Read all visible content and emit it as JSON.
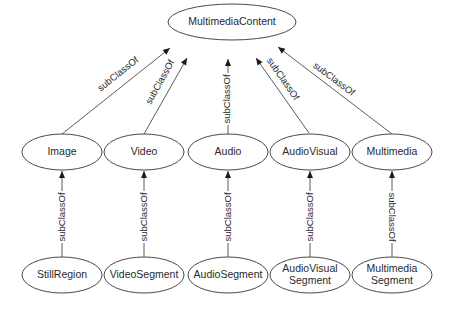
{
  "diagram": {
    "type": "class-hierarchy",
    "root": {
      "id": "multimedia-content",
      "label": "MultimediaContent",
      "cx": 232,
      "cy": 22,
      "rx": 64,
      "ry": 18
    },
    "level1": [
      {
        "id": "image",
        "label": "Image",
        "cx": 62,
        "cy": 152,
        "rx": 40,
        "ry": 18
      },
      {
        "id": "video",
        "label": "Video",
        "cx": 144,
        "cy": 152,
        "rx": 40,
        "ry": 18
      },
      {
        "id": "audio",
        "label": "Audio",
        "cx": 228,
        "cy": 152,
        "rx": 40,
        "ry": 18
      },
      {
        "id": "audiovisual",
        "label": "AudioVisual",
        "cx": 310,
        "cy": 152,
        "rx": 40,
        "ry": 18
      },
      {
        "id": "multimedia",
        "label": "Multimedia",
        "cx": 392,
        "cy": 152,
        "rx": 40,
        "ry": 18
      }
    ],
    "level2": [
      {
        "id": "still-region",
        "label_lines": [
          "StillRegion"
        ],
        "cx": 62,
        "cy": 275,
        "rx": 40,
        "ry": 18
      },
      {
        "id": "video-segment",
        "label_lines": [
          "VideoSegment"
        ],
        "cx": 144,
        "cy": 275,
        "rx": 40,
        "ry": 18
      },
      {
        "id": "audio-segment",
        "label_lines": [
          "AudioSegment"
        ],
        "cx": 228,
        "cy": 275,
        "rx": 40,
        "ry": 18
      },
      {
        "id": "audiovisual-segment",
        "label_lines": [
          "AudioVisual",
          "Segment"
        ],
        "cx": 310,
        "cy": 275,
        "rx": 40,
        "ry": 18
      },
      {
        "id": "multimedia-segment",
        "label_lines": [
          "Multimedia",
          "Segment"
        ],
        "cx": 392,
        "cy": 275,
        "rx": 40,
        "ry": 18
      }
    ],
    "edges": [
      {
        "from": "image",
        "to": "multimedia-content",
        "label": "subClassOf",
        "x1": 62,
        "y1": 134,
        "x2": 170,
        "y2": 48,
        "lx": 118,
        "ly": 74,
        "angle": -38.5
      },
      {
        "from": "video",
        "to": "multimedia-content",
        "label": "subClassOf",
        "x1": 144,
        "y1": 134,
        "x2": 187,
        "y2": 58,
        "lx": 160,
        "ly": 82,
        "angle": -61
      },
      {
        "from": "audio",
        "to": "multimedia-content",
        "label": "subClassOf",
        "x1": 228,
        "y1": 134,
        "x2": 228,
        "y2": 59,
        "lx": 227,
        "ly": 99,
        "angle": -90
      },
      {
        "from": "audiovisual",
        "to": "multimedia-content",
        "label": "subClassOf",
        "x1": 309,
        "y1": 133,
        "x2": 256,
        "y2": 58,
        "lx": 283,
        "ly": 79,
        "angle": 55
      },
      {
        "from": "multimedia",
        "to": "multimedia-content",
        "label": "subClassOf",
        "x1": 392,
        "y1": 134,
        "x2": 278,
        "y2": 47,
        "lx": 334,
        "ly": 79,
        "angle": 37
      },
      {
        "from": "still-region",
        "to": "image",
        "label": "subClassOf",
        "x1": 62,
        "y1": 257,
        "x2": 62,
        "y2": 171,
        "lx": 62,
        "ly": 217,
        "angle": -90
      },
      {
        "from": "video-segment",
        "to": "video",
        "label": "subClassOf",
        "x1": 144,
        "y1": 257,
        "x2": 144,
        "y2": 171,
        "lx": 144,
        "ly": 217,
        "angle": -90
      },
      {
        "from": "audio-segment",
        "to": "audio",
        "label": "subClassOf",
        "x1": 228,
        "y1": 257,
        "x2": 228,
        "y2": 171,
        "lx": 228,
        "ly": 217,
        "angle": -90
      },
      {
        "from": "audiovisual-segment",
        "to": "audiovisual",
        "label": "subClassOf",
        "x1": 310,
        "y1": 257,
        "x2": 310,
        "y2": 171,
        "lx": 310,
        "ly": 217,
        "angle": -90
      },
      {
        "from": "multimedia-segment",
        "to": "multimedia",
        "label": "subClassOf",
        "x1": 392,
        "y1": 257,
        "x2": 392,
        "y2": 171,
        "lx": 392,
        "ly": 217,
        "angle": 90
      }
    ]
  }
}
